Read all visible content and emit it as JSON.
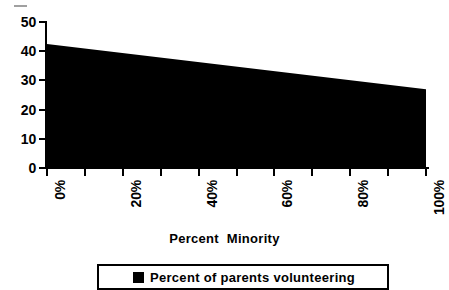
{
  "chart_data": {
    "type": "area",
    "title": "",
    "xlabel": "Percent  Minority",
    "ylabel": "",
    "xlim": [
      0,
      100
    ],
    "ylim": [
      0,
      50
    ],
    "grid": false,
    "legend_position": "bottom",
    "x": [
      0,
      100
    ],
    "series": [
      {
        "name": "Percent of parents volunteering",
        "color": "#000000",
        "values": [
          42.5,
          27.0
        ]
      }
    ],
    "x_tick_labels": [
      "0%",
      "20%",
      "40%",
      "60%",
      "80%",
      "100%"
    ],
    "x_tick_values": [
      0,
      20,
      40,
      60,
      80,
      100
    ],
    "x_minor_tick_values": [
      0,
      10,
      20,
      30,
      40,
      50,
      60,
      70,
      80,
      90,
      100
    ],
    "y_tick_labels": [
      "50",
      "40",
      "30",
      "20",
      "10",
      "0"
    ],
    "y_tick_values": [
      50,
      40,
      30,
      20,
      10,
      0
    ]
  },
  "axes": {
    "y_ticks": [
      {
        "label": "50",
        "value": 50
      },
      {
        "label": "40",
        "value": 40
      },
      {
        "label": "30",
        "value": 30
      },
      {
        "label": "20",
        "value": 20
      },
      {
        "label": "10",
        "value": 10
      },
      {
        "label": "0",
        "value": 0
      }
    ],
    "x_ticks": [
      {
        "label": "0%",
        "value": 0
      },
      {
        "label": "20%",
        "value": 20
      },
      {
        "label": "40%",
        "value": 40
      },
      {
        "label": "60%",
        "value": 60
      },
      {
        "label": "80%",
        "value": 80
      },
      {
        "label": "100%",
        "value": 100
      }
    ],
    "x_title": "Percent  Minority"
  },
  "legend": {
    "entries": [
      {
        "label": "Percent of parents volunteering",
        "color": "#000000",
        "marker": "filled-square"
      }
    ]
  },
  "colors": {
    "series_fill": "#000000",
    "axis": "#000000",
    "background": "#ffffff"
  }
}
